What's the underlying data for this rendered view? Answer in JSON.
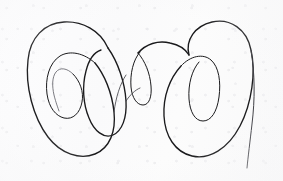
{
  "artwork": {
    "title": "Handwritten continuous-line loop doodle",
    "medium": "Ink pen on paper",
    "description": "A single continuous looping pen stroke forming interlocking spirals resembling cursive letters",
    "caption": "",
    "alt_text": "Scanned hand-drawn ink doodle of three nested loop clusters on off-white paper"
  },
  "canvas": {
    "width": 283,
    "height": 181,
    "background_color": "#fcfcfc",
    "paper_tint": "#fafafb",
    "ink_color": "#1a1a1c",
    "ink_fade_color": "#3a3a40",
    "ink_faint_color": "#5b5b62"
  },
  "strokes": {
    "left_outer_loop": {
      "name": "left-outer-loop",
      "path": "M 108 48 C 100 30 82 21 64 22 C 44 23 30 38 28 60 C 25 86 33 117 48 137 C 61 154 80 160 95 154 C 110 148 116 131 114 112 C 112 92 104 74 95 63"
    },
    "left_inner_spiral": {
      "name": "left-inner-spiral",
      "path": "M 95 63 C 84 53 70 50 60 56 C 49 63 45 79 47 94 C 49 108 56 116 64 118 C 73 120 80 113 82 102 C 84 92 80 81 73 74"
    },
    "left_spiral_tail": {
      "name": "left-spiral-tail",
      "path": "M 73 74 C 67 68 60 67 56 72 C 52 77 52 86 54 95 C 56 103 58 108 59 111"
    },
    "left_mid_loop": {
      "name": "left-middle-loop",
      "path": "M 108 48 C 118 62 125 83 126 101 C 127 118 122 131 113 135 C 104 139 94 131 89 118 C 83 104 82 86 86 71 C 89 59 95 52 101 50"
    },
    "center_small_loop": {
      "name": "center-small-loop",
      "path": "M 140 52 C 133 60 130 74 131 87 C 132 98 137 105 143 105 C 149 105 152 97 151 86 C 150 73 145 61 138 53"
    },
    "center_link": {
      "name": "center-connector",
      "path": "M 138 53 C 146 44 158 40 170 43 C 180 45 186 50 189 55"
    },
    "right_outer_loop": {
      "name": "right-outer-loop",
      "path": "M 189 55 C 185 40 195 26 212 22 C 230 18 247 29 251 50 C 256 72 252 103 240 126 C 228 149 209 160 192 156 C 175 152 165 136 164 116 C 163 96 170 78 181 66"
    },
    "right_inner_loop": {
      "name": "right-inner-loop",
      "path": "M 181 66 C 190 56 203 53 211 60 C 219 67 221 82 219 97 C 217 112 211 121 203 121 C 195 121 190 112 189 99 C 188 84 192 70 199 62"
    },
    "right_descender_tail": {
      "name": "right-descender-tail",
      "path": "M 251 50 C 255 74 255 100 252 124 C 250 142 248 157 247 168"
    },
    "left_low_arc": {
      "name": "left-lower-connector-arc",
      "path": "M 114 112 C 116 97 120 84 126 75"
    },
    "center_low_link": {
      "name": "center-lower-connector",
      "path": "M 126 101 C 130 95 135 90 140 88"
    }
  },
  "meta": {
    "stroke_count": 11,
    "dominant_form": "loops",
    "orientation": "landscape"
  }
}
